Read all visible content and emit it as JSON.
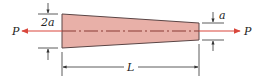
{
  "diagram": {
    "labels": {
      "load_left": "P",
      "load_right": "P",
      "left_height": "2a",
      "right_height": "a",
      "length": "L"
    },
    "colors": {
      "bar_fill": "#e8b0a8",
      "bar_stroke": "#5a4545",
      "load_arrow": "#d9473c",
      "dim_line": "#333333"
    }
  }
}
